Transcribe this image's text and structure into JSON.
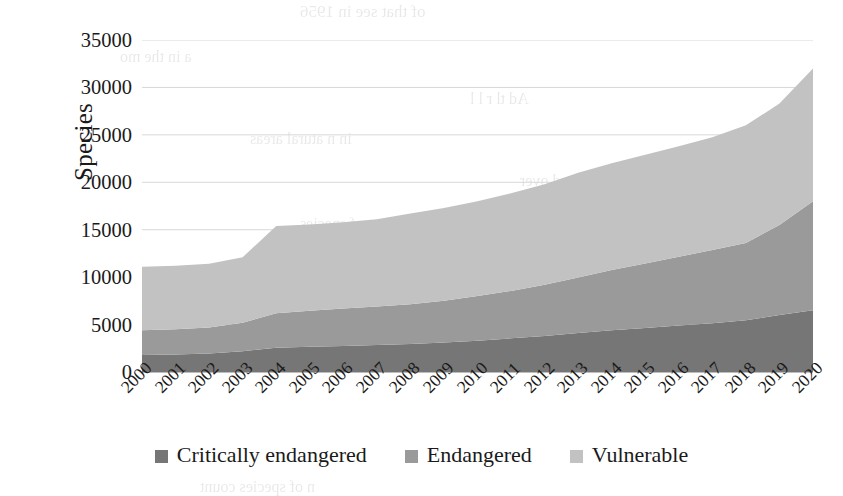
{
  "chart_data": {
    "type": "area",
    "stacked": true,
    "title": "",
    "subtitle": "",
    "xlabel": "",
    "ylabel": "Species",
    "categories": [
      "2000",
      "2001",
      "2002",
      "2003",
      "2004",
      "2005",
      "2006",
      "2007",
      "2008",
      "2009",
      "2010",
      "2011",
      "2012",
      "2013",
      "2014",
      "2015",
      "2016",
      "2017",
      "2018",
      "2019",
      "2020"
    ],
    "series": [
      {
        "name": "Critically endangered",
        "color": "#767676",
        "values": [
          1800,
          1850,
          1950,
          2200,
          2550,
          2650,
          2750,
          2850,
          2950,
          3100,
          3300,
          3550,
          3800,
          4100,
          4400,
          4650,
          4900,
          5150,
          5450,
          6000,
          6500
        ]
      },
      {
        "name": "Endangered",
        "color": "#9a9a9a",
        "values": [
          2600,
          2650,
          2750,
          3000,
          3650,
          3800,
          3950,
          4050,
          4200,
          4400,
          4700,
          5000,
          5400,
          5850,
          6350,
          6800,
          7250,
          7700,
          8150,
          9500,
          11500
        ]
      },
      {
        "name": "Vulnerable",
        "color": "#c2c2c2",
        "values": [
          6700,
          6700,
          6700,
          6900,
          9200,
          9100,
          9100,
          9200,
          9550,
          9800,
          10000,
          10300,
          10600,
          11050,
          11250,
          11450,
          11650,
          11900,
          12400,
          12800,
          14000
        ]
      }
    ],
    "totals": [
      11100,
      11200,
      11400,
      12100,
      15400,
      15550,
      15800,
      16100,
      16700,
      17300,
      18000,
      18850,
      19800,
      21000,
      22000,
      22900,
      23800,
      24750,
      26000,
      28300,
      32000
    ],
    "yticks": [
      "0",
      "5000",
      "10000",
      "15000",
      "20000",
      "25000",
      "30000",
      "35000"
    ],
    "ytick_values": [
      0,
      5000,
      10000,
      15000,
      20000,
      25000,
      30000,
      35000
    ],
    "ylim": [
      0,
      35000
    ],
    "grid": true,
    "grid_axis": "y",
    "legend_position": "bottom",
    "legend": [
      {
        "label": "Critically endangered",
        "color": "#767676"
      },
      {
        "label": "Endangered",
        "color": "#9a9a9a"
      },
      {
        "label": "Vulnerable",
        "color": "#c2c2c2"
      }
    ]
  },
  "axis": {
    "y_title": "Species"
  },
  "colors": {
    "critically_endangered": "#767676",
    "endangered": "#9a9a9a",
    "vulnerable": "#c2c2c2",
    "gridline": "#d8d8d8",
    "axisline": "#bdbdbd",
    "text": "#1a1a1a",
    "background": "#ffffff"
  },
  "ghost_text": [
    {
      "text": "of that see in 1956",
      "x": 300,
      "y": 2,
      "size": 17
    },
    {
      "text": "a in the mo",
      "x": 120,
      "y": 48,
      "size": 16
    },
    {
      "text": "Ad  tl r  l  l",
      "x": 470,
      "y": 90,
      "size": 16
    },
    {
      "text": "in n  atural  areas",
      "x": 250,
      "y": 130,
      "size": 16
    },
    {
      "text": "h  and  over",
      "x": 520,
      "y": 172,
      "size": 16
    },
    {
      "text": "t  of  species",
      "x": 300,
      "y": 215,
      "size": 16
    },
    {
      "text": "e species",
      "x": 560,
      "y": 252,
      "size": 16
    },
    {
      "text": "ular  species",
      "x": 150,
      "y": 300,
      "size": 16
    },
    {
      "text": "the  global  list",
      "x": 430,
      "y": 340,
      "size": 16
    },
    {
      "text": "n  of  species  count",
      "x": 200,
      "y": 478,
      "size": 16
    }
  ]
}
